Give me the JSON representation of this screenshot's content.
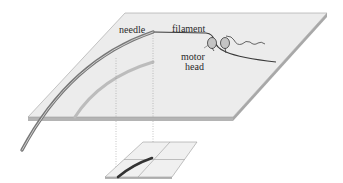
{
  "diagram": {
    "title": "",
    "labels": {
      "needle": "needle",
      "filament": "filament",
      "motor_head_line1": "motor",
      "motor_head_line2": "head"
    },
    "components": [
      {
        "id": "top-plane",
        "description": "tilted glass surface plane (perspective)"
      },
      {
        "id": "needle",
        "description": "curved needle rising off the surface, attached to filament"
      },
      {
        "id": "filament",
        "description": "filament attached to needle tip, bound by motor heads"
      },
      {
        "id": "motor-heads",
        "description": "two oval motor heads on the filament"
      },
      {
        "id": "needle-shadow",
        "description": "grey projection of needle onto the plane"
      },
      {
        "id": "projection-lines",
        "description": "dotted vertical lines projecting down to detector"
      },
      {
        "id": "quadrant-detector",
        "description": "small lower plane divided into four quadrants with dark projected needle image"
      }
    ],
    "colors": {
      "plane_fill": "#e9e9e9",
      "plane_edge": "#9a9a9a",
      "plane_side": "#b4b4b4",
      "needle": "#8a8a8a",
      "needle_highlight": "#cfcfcf",
      "filament": "#3a3a3a",
      "shadow": "#b8b8b8",
      "motor_head": "#bdbdbd",
      "detector_image": "#3c3c3c"
    }
  }
}
